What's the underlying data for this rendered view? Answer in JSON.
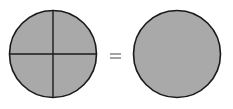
{
  "diagram": {
    "equation": "4/4 = 1",
    "left_shape": {
      "type": "circle",
      "parts": 4,
      "shaded_parts": 4
    },
    "operator": "=",
    "right_shape": {
      "type": "circle",
      "parts": 1,
      "shaded_parts": 1
    },
    "colors": {
      "fill": "#a9a9a9",
      "stroke": "#1a1a1a",
      "background": "#ffffff",
      "operator": "#666666"
    }
  }
}
